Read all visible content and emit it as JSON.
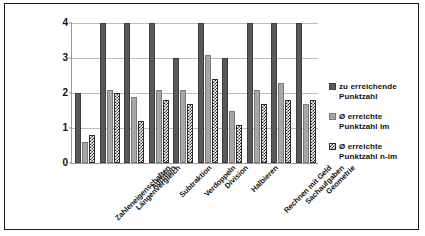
{
  "chart_data": {
    "type": "bar",
    "title": "",
    "xlabel": "",
    "ylabel": "",
    "ylim": [
      0,
      4
    ],
    "yticks": [
      "0",
      "1",
      "2",
      "3",
      "4"
    ],
    "grid": true,
    "legend_position": "right",
    "categories": [
      "Zahleneigenschaften",
      "Längenvergleich",
      "Addition",
      "Subtraktion",
      "Verdoppeln",
      "Division",
      "Halbieren",
      "Rechnen mit Geld",
      "Sachaufgaben",
      "Geometrie"
    ],
    "series": [
      {
        "name": "zu erreichende Punktzahl",
        "color": "#595959",
        "pattern": "solid-dark",
        "values": [
          2,
          4,
          4,
          4,
          3,
          4,
          3,
          4,
          4,
          4
        ]
      },
      {
        "name": "Ø erreichte Punktzahl im",
        "color": "#a6a6a6",
        "pattern": "solid-light",
        "values": [
          0.6,
          2.1,
          1.9,
          2.1,
          2.1,
          3.1,
          1.5,
          2.1,
          2.3,
          1.7
        ]
      },
      {
        "name": "Ø erreichte Punktzahl n-im",
        "color": "#262626",
        "pattern": "checkered",
        "values": [
          0.8,
          2.0,
          1.2,
          1.8,
          1.7,
          2.4,
          1.1,
          1.7,
          1.8,
          1.8
        ]
      }
    ]
  },
  "legend": {
    "items": [
      {
        "label_line1": "zu erreichende",
        "label_line2": "Punktzahl"
      },
      {
        "label_line1": "Ø erreichte",
        "label_line2": "Punktzahl im"
      },
      {
        "label_line1": "Ø erreichte",
        "label_line2": "Punktzahl n-im"
      }
    ]
  }
}
